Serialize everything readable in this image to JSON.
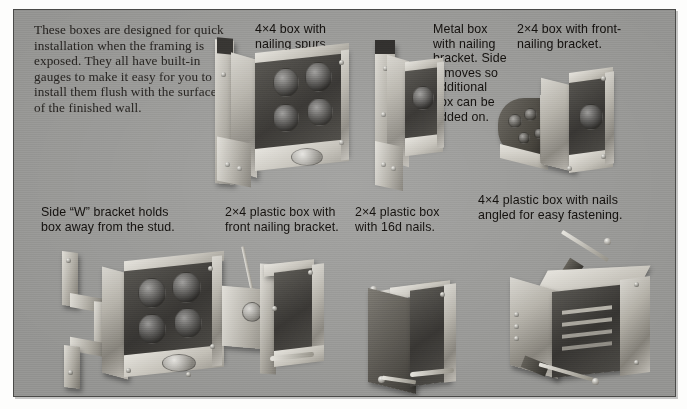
{
  "page": {
    "background_color": "#ffffff",
    "plate_color": "#9e9e9c",
    "plate_border_color": "#4a4a48",
    "text_color": "#15120f"
  },
  "intro": {
    "text": "These boxes are designed for quick installation when the framing is exposed. They all have built-in gauges to make it easy for you to install them flush with the surface of the finished wall."
  },
  "top_row": {
    "captions": [
      {
        "id": "caption-4x4-nailing-spurs",
        "text": "4×4 box with\nnailing spurs."
      },
      {
        "id": "caption-metal-box-nailing-bracket",
        "text": "Metal box\nwith nailing\nbracket. Side\nremoves so\nadditional\nbox can be\nadded on."
      },
      {
        "id": "caption-2x4-front-nailing-bracket",
        "text": "2×4 box with front-\nnailing bracket."
      }
    ],
    "objects": [
      {
        "id": "object-4x4-metal-box-with-spurs",
        "label": "4×4 metal box with nailing spurs"
      },
      {
        "id": "object-2x4-metal-box-with-bracket",
        "label": "2×4 metal box with side nailing bracket"
      },
      {
        "id": "object-metal-box-removable-side",
        "label": "Metal box with nailing bracket and removable side"
      },
      {
        "id": "object-2x4-box-front-nailing-bracket",
        "label": "2×4 box with front-nailing bracket"
      }
    ]
  },
  "bottom_row": {
    "captions": [
      {
        "id": "caption-side-w-bracket",
        "text": "Side “W” bracket holds\nbox away from the stud."
      },
      {
        "id": "caption-2x4-plastic-front-bracket",
        "text": "2×4 plastic box with\nfront nailing bracket."
      },
      {
        "id": "caption-2x4-plastic-16d-nails",
        "text": "2×4 plastic box\nwith 16d nails."
      },
      {
        "id": "caption-4x4-plastic-angled-nails",
        "text": "4×4 plastic box with nails\nangled for easy fastening."
      }
    ],
    "objects": [
      {
        "id": "object-4x4-box-side-w-bracket",
        "label": "4×4 metal box with side W bracket"
      },
      {
        "id": "object-2x4-plastic-box-front-bracket",
        "label": "2×4 plastic box with front nailing bracket"
      },
      {
        "id": "object-2x4-plastic-box-16d-nails",
        "label": "2×4 plastic box with 16d nails"
      },
      {
        "id": "object-4x4-plastic-box-angled-nails",
        "label": "4×4 plastic box with angled nails"
      }
    ]
  }
}
